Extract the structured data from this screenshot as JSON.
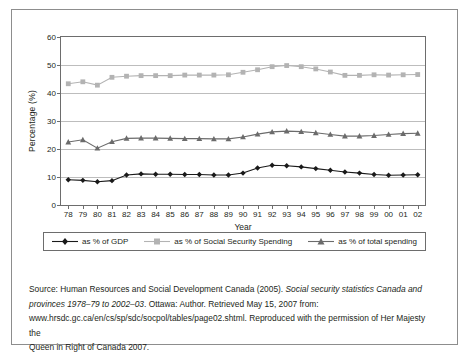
{
  "chart_data": {
    "type": "line",
    "title": "",
    "xlabel": "Year",
    "ylabel": "Percentage (%)",
    "x": [
      "78",
      "79",
      "80",
      "81",
      "82",
      "83",
      "84",
      "85",
      "86",
      "87",
      "88",
      "89",
      "90",
      "91",
      "92",
      "93",
      "94",
      "95",
      "96",
      "97",
      "98",
      "99",
      "00",
      "01",
      "02"
    ],
    "ylim": [
      0,
      60
    ],
    "yticks": [
      0,
      10,
      20,
      30,
      40,
      50,
      60
    ],
    "grid": true,
    "legend_position": "bottom",
    "series": [
      {
        "name": "as % of GDP",
        "color": "#1a1a1a",
        "marker": "diamond",
        "values": [
          9.0,
          8.8,
          8.3,
          8.7,
          10.7,
          11.1,
          11.0,
          11.0,
          10.9,
          10.9,
          10.7,
          10.7,
          11.4,
          13.2,
          14.2,
          14.0,
          13.6,
          13.0,
          12.4,
          11.8,
          11.4,
          10.9,
          10.6,
          10.7,
          10.8
        ]
      },
      {
        "name": "as % of Social Security Spending",
        "color": "#b3b3b3",
        "marker": "square",
        "values": [
          43.3,
          44.0,
          42.8,
          45.6,
          46.0,
          46.2,
          46.2,
          46.2,
          46.4,
          46.4,
          46.4,
          46.5,
          47.4,
          48.3,
          49.4,
          49.8,
          49.4,
          48.6,
          47.5,
          46.3,
          46.3,
          46.5,
          46.4,
          46.5,
          46.6
        ]
      },
      {
        "name": "as % of total spending",
        "color": "#6b6b6b",
        "marker": "triangle",
        "values": [
          22.5,
          23.3,
          20.3,
          22.6,
          23.8,
          23.9,
          23.9,
          23.8,
          23.7,
          23.7,
          23.6,
          23.6,
          24.3,
          25.3,
          26.1,
          26.4,
          26.2,
          25.8,
          25.2,
          24.6,
          24.6,
          24.8,
          25.2,
          25.5,
          25.6
        ]
      }
    ]
  },
  "source": {
    "line1_a": "Source: Human Resources and Social Development Canada (2005). ",
    "line1_italic": "Social security statistics Canada and",
    "line2_italic": "provinces 1978–79 to 2002–03",
    "line2_b": ". Ottawa: Author. Retrieved May 15, 2007 from:",
    "line3": "www.hrsdc.gc.ca/en/cs/sp/sdc/socpol/tables/page02.shtml. Reproduced with the permission of Her Majesty the",
    "line4": "Queen in Right of Canada 2007."
  }
}
